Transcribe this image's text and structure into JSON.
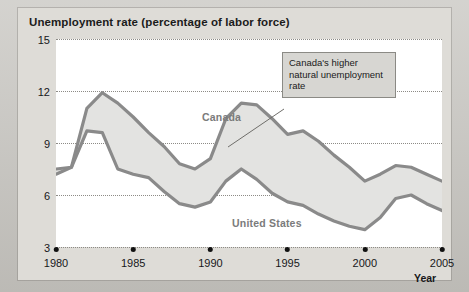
{
  "figure": {
    "title": "Unemployment rate (percentage of labor force)",
    "axis_title_x": "Year",
    "callout_text": "Canada's higher natural unemployment rate",
    "label_canada": "Canada",
    "label_united_states": "United States",
    "colors": {
      "page_background": "#c6c4bf",
      "card_background": "#dedcd7",
      "plot_background": "#ffffff",
      "series_line": "#8a8a8a",
      "band_fill": "#e3e3e1",
      "gridline": "#8d8b86",
      "callout_background": "#d7d6d2",
      "callout_border": "#8b8a85",
      "text": "#17171a",
      "series_label": "#7b7b7b"
    }
  },
  "chart_data": {
    "type": "line",
    "title": "Unemployment rate (percentage of labor force)",
    "xlabel": "Year",
    "ylabel": "Unemployment rate (percentage of labor force)",
    "xlim": [
      1980,
      2005
    ],
    "ylim": [
      3,
      15
    ],
    "yticks": [
      3,
      6,
      9,
      12,
      15
    ],
    "ytick_labels": [
      "3",
      "6",
      "9",
      "12",
      "15"
    ],
    "xticks": [
      1980,
      1985,
      1990,
      1995,
      2000,
      2005
    ],
    "xtick_labels": [
      "1980",
      "1985",
      "1990",
      "1995",
      "2000",
      "2005"
    ],
    "grid": "horizontal-dotted",
    "legend": "inline-labels",
    "shaded_band": "area between Canada and United States lines",
    "annotations": [
      {
        "text": "Canada's higher natural unemployment rate",
        "points_to": "Canada line",
        "style": "boxed-callout-with-leader-line"
      }
    ],
    "x": [
      1980,
      1981,
      1982,
      1983,
      1984,
      1985,
      1986,
      1987,
      1988,
      1989,
      1990,
      1991,
      1992,
      1993,
      1994,
      1995,
      1996,
      1997,
      1998,
      1999,
      2000,
      2001,
      2002,
      2003,
      2004,
      2005
    ],
    "series": [
      {
        "name": "Canada",
        "values": [
          7.5,
          7.6,
          11.0,
          11.9,
          11.3,
          10.5,
          9.6,
          8.8,
          7.8,
          7.5,
          8.1,
          10.4,
          11.3,
          11.2,
          10.4,
          9.5,
          9.7,
          9.1,
          8.3,
          7.6,
          6.8,
          7.2,
          7.7,
          7.6,
          7.2,
          6.8
        ]
      },
      {
        "name": "United States",
        "values": [
          7.2,
          7.6,
          9.7,
          9.6,
          7.5,
          7.2,
          7.0,
          6.2,
          5.5,
          5.3,
          5.6,
          6.8,
          7.5,
          6.9,
          6.1,
          5.6,
          5.4,
          4.9,
          4.5,
          4.2,
          4.0,
          4.7,
          5.8,
          6.0,
          5.5,
          5.1
        ]
      }
    ]
  }
}
